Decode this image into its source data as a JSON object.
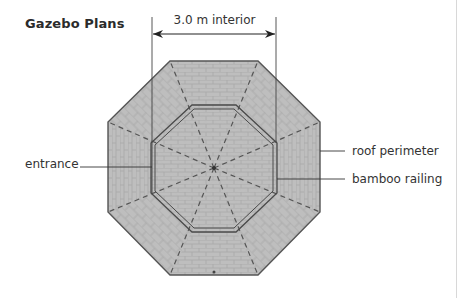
{
  "diagram": {
    "title": "Gazebo Plans",
    "dimension": {
      "label": "3.0 m interior",
      "arrow": "double-headed"
    },
    "callouts": {
      "entrance": "entrance",
      "roof_perimeter": "roof perimeter",
      "bamboo_railing": "bamboo railing"
    },
    "shape": "octagon",
    "colors": {
      "roof_fill": "#b9b9b9",
      "tile_line": "#9d9d9d",
      "outline": "#555555",
      "dash": "#555555",
      "text": "#333333"
    }
  }
}
